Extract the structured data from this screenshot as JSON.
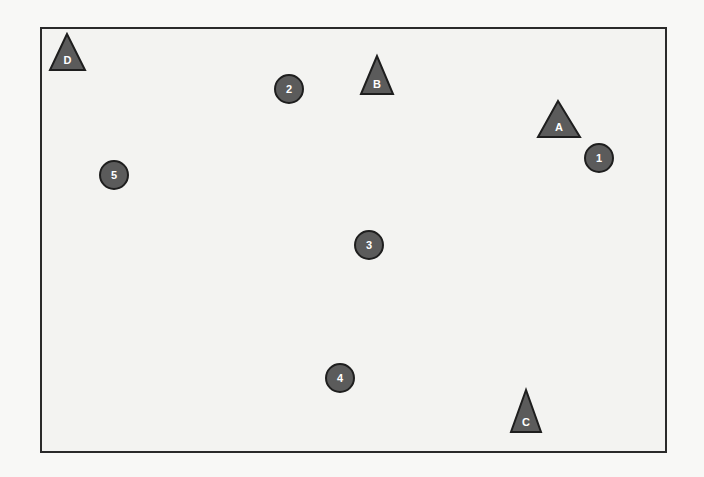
{
  "diagram": {
    "colors": {
      "shape_fill": "#5b5b5b",
      "shape_stroke": "#1e1e1e",
      "label_color": "#ffffff",
      "frame_border": "#2a2a2a",
      "background": "#f8f8f6"
    },
    "triangles": [
      {
        "label": "D",
        "apex": [
          67,
          34
        ],
        "base_left": [
          50,
          70
        ],
        "base_right": [
          85,
          70
        ]
      },
      {
        "label": "B",
        "apex": [
          377,
          56
        ],
        "base_left": [
          361,
          94
        ],
        "base_right": [
          393,
          94
        ]
      },
      {
        "label": "A",
        "apex": [
          558,
          101
        ],
        "base_left": [
          538,
          137
        ],
        "base_right": [
          580,
          137
        ]
      },
      {
        "label": "C",
        "apex": [
          526,
          390
        ],
        "base_left": [
          511,
          432
        ],
        "base_right": [
          541,
          432
        ]
      }
    ],
    "circles": [
      {
        "label": "1",
        "cx": 599,
        "cy": 158,
        "r": 15
      },
      {
        "label": "2",
        "cx": 289,
        "cy": 89,
        "r": 15
      },
      {
        "label": "3",
        "cx": 369,
        "cy": 245,
        "r": 15
      },
      {
        "label": "4",
        "cx": 340,
        "cy": 378,
        "r": 15
      },
      {
        "label": "5",
        "cx": 114,
        "cy": 175,
        "r": 15
      }
    ]
  }
}
